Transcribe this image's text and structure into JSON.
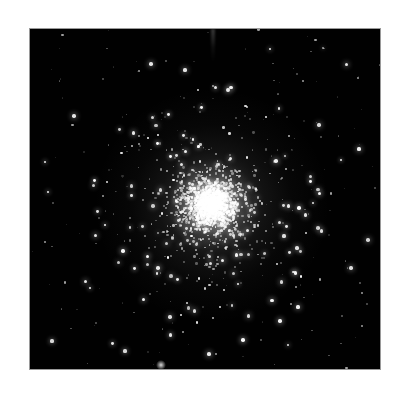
{
  "page": {
    "background_color": "#ffffff",
    "width": 405,
    "height": 399
  },
  "image_panel": {
    "name": "astronomical-image",
    "subject": "globular star cluster",
    "background_color": "#000000",
    "border_color": "#9a9a9a",
    "x": 29,
    "y": 28,
    "width": 352,
    "height": 342,
    "caption": "",
    "credit": ""
  },
  "chart_data": {
    "type": "scatter",
    "title": "",
    "subtitle": "",
    "xlabel": "",
    "ylabel": "",
    "grid": false,
    "legend": "none",
    "xlim": [
      0,
      352
    ],
    "ylim": [
      0,
      342
    ],
    "cluster": {
      "center_x": 182,
      "center_y": 176,
      "core_radius": 18,
      "half_light_radius": 42,
      "halo_radius": 96,
      "core_peak_brightness": 1.0,
      "member_star_count": 1450
    },
    "field": {
      "field_star_count": 170,
      "sky_background_level": 0.004
    },
    "artifacts": [
      {
        "name": "top-streak",
        "x": 181,
        "y": 0,
        "width": 4,
        "height": 34,
        "intensity": 0.22
      },
      {
        "name": "bottom-flare",
        "x": 131,
        "y": 336,
        "radius": 5,
        "intensity": 0.85
      }
    ],
    "glow_layers": [
      {
        "name": "outer-halo",
        "center_x": 182,
        "center_y": 176,
        "radius": 118,
        "peak_alpha": 0.3
      },
      {
        "name": "inner-core",
        "center_x": 182,
        "center_y": 176,
        "radius": 46,
        "peak_alpha": 0.92
      }
    ]
  }
}
